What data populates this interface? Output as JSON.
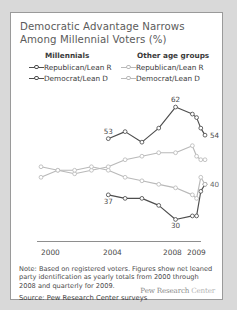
{
  "title": "Democratic Advantage Narrows Among Millennial Voters (%)",
  "legend": {
    "groups": [
      {
        "heading": "Millennials",
        "style": "dark",
        "items": [
          {
            "label": "Republican/Lean R",
            "series": "millennial_rep"
          },
          {
            "label": "Democrat/Lean D",
            "series": "millennial_dem"
          }
        ]
      },
      {
        "heading": "Other age groups",
        "style": "light",
        "items": [
          {
            "label": "Republican/Lean R",
            "series": "other_rep"
          },
          {
            "label": "Democrat/Lean D",
            "series": "other_dem"
          }
        ]
      }
    ]
  },
  "axis": {
    "ticks": [
      {
        "label": "2000",
        "x": 30
      },
      {
        "label": "2004",
        "x": 92
      },
      {
        "label": "2008",
        "x": 152
      },
      {
        "label": "2009",
        "x": 176
      }
    ]
  },
  "note": "Note: Based on registered voters. Figures show net leaned party identification as yearly totals from 2000 through 2008 and quarterly for 2009.",
  "source": "Source: Pew Research Center surveys",
  "wordmark": {
    "bold": "Pew Research",
    "light": "Center"
  },
  "colors": {
    "millennial_line": "#4d4d4d",
    "other_line": "#b9b9b9",
    "axis": "#8e8e8e",
    "title_text": "#5b5b5b",
    "card_bg": "#ffffff",
    "page_bg": "#d9d9d9"
  },
  "chart_data": {
    "type": "line",
    "title": "Democratic Advantage Narrows Among Millennial Voters (%)",
    "xlabel": "",
    "ylabel": "",
    "ylim": [
      25,
      66
    ],
    "xlim": [
      2000,
      2009.75
    ],
    "grid": false,
    "legend_position": "top",
    "x": [
      2000,
      2001,
      2002,
      2003,
      2004,
      2005,
      2006,
      2007,
      2008,
      2009.0,
      2009.25,
      2009.5,
      2009.75
    ],
    "x_tick_labels": [
      "2000",
      "2004",
      "2008",
      "2009"
    ],
    "series": [
      {
        "name": "Millennials Democrat/Lean D",
        "group": "Millennials",
        "party": "Democrat/Lean D",
        "color": "#4d4d4d",
        "x": [
          2004,
          2005,
          2006,
          2007,
          2008,
          2009.0,
          2009.25,
          2009.5,
          2009.75
        ],
        "values": [
          53,
          55,
          52,
          56,
          62,
          60,
          59,
          56,
          54
        ],
        "labels": [
          {
            "x": 2004,
            "value": 53,
            "text": "53"
          },
          {
            "x": 2008,
            "value": 62,
            "text": "62"
          },
          {
            "x": 2009.75,
            "value": 54,
            "text": "54"
          }
        ]
      },
      {
        "name": "Millennials Republican/Lean R",
        "group": "Millennials",
        "party": "Republican/Lean R",
        "color": "#4d4d4d",
        "x": [
          2004,
          2005,
          2006,
          2007,
          2008,
          2009.0,
          2009.25,
          2009.5,
          2009.75
        ],
        "values": [
          37,
          36,
          36,
          34,
          30,
          31,
          31,
          38,
          40
        ],
        "labels": [
          {
            "x": 2004,
            "value": 37,
            "text": "37"
          },
          {
            "x": 2008,
            "value": 30,
            "text": "30"
          }
        ]
      },
      {
        "name": "Other age groups Democrat/Lean D",
        "group": "Other age groups",
        "party": "Democrat/Lean D",
        "color": "#b9b9b9",
        "x": [
          2000,
          2001,
          2002,
          2003,
          2004,
          2005,
          2006,
          2007,
          2008,
          2009.0,
          2009.25,
          2009.5,
          2009.75
        ],
        "values": [
          42,
          44,
          43,
          44,
          45,
          47,
          48,
          49,
          49,
          51,
          48,
          47,
          47
        ],
        "labels": []
      },
      {
        "name": "Other age groups Republican/Lean R",
        "group": "Other age groups",
        "party": "Republican/Lean R",
        "color": "#b9b9b9",
        "x": [
          2000,
          2001,
          2002,
          2003,
          2004,
          2005,
          2006,
          2007,
          2008,
          2009.0,
          2009.25,
          2009.5,
          2009.75
        ],
        "values": [
          45,
          44,
          44,
          45,
          44,
          42,
          41,
          40,
          39,
          37,
          36,
          42,
          40
        ],
        "labels": [
          {
            "x": 2009.75,
            "value": 40,
            "text": "40"
          }
        ]
      }
    ],
    "annotations": [
      "53",
      "62",
      "54",
      "37",
      "30",
      "40"
    ]
  }
}
